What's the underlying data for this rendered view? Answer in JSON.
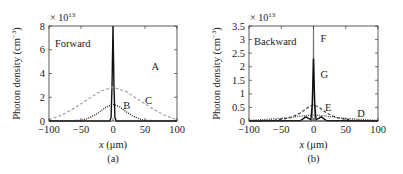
{
  "chart_data": [
    {
      "panel": "(a)",
      "type": "line",
      "title": "Forward",
      "xlabel": "x (μm)",
      "ylabel": "Photon density (cm⁻³)",
      "y_multiplier": "× 10¹³",
      "xlim": [
        -100,
        100
      ],
      "ylim": [
        0,
        8
      ],
      "xticks": [
        -100,
        -50,
        0,
        50,
        100
      ],
      "yticks": [
        0,
        2,
        4,
        6,
        8
      ],
      "grid": false,
      "series": [
        {
          "name": "A",
          "style": "solid",
          "color": "#111111",
          "x": [
            -100,
            -5,
            -3,
            -1.5,
            0,
            1.5,
            3,
            5,
            100
          ],
          "values": [
            0,
            0,
            0.3,
            3.0,
            8.0,
            3.0,
            0.3,
            0,
            0
          ]
        },
        {
          "name": "B",
          "style": "dotted",
          "color": "#222222",
          "x": [
            -100,
            -50,
            -40,
            -30,
            -20,
            -10,
            0,
            10,
            20,
            30,
            40,
            50,
            100
          ],
          "values": [
            0,
            0.05,
            0.2,
            0.45,
            0.8,
            1.2,
            1.4,
            1.2,
            0.8,
            0.45,
            0.2,
            0.05,
            0
          ]
        },
        {
          "name": "C",
          "style": "dashed",
          "color": "#999999",
          "x": [
            -100,
            -80,
            -60,
            -40,
            -20,
            0,
            20,
            40,
            60,
            80,
            100
          ],
          "values": [
            0.1,
            0.5,
            1.1,
            1.8,
            2.5,
            2.85,
            2.5,
            1.8,
            1.1,
            0.5,
            0.1
          ]
        }
      ],
      "annotations": [
        "A",
        "B",
        "C"
      ]
    },
    {
      "panel": "(b)",
      "type": "line",
      "title": "Backward",
      "xlabel": "x (μm)",
      "ylabel": "Photon density (cm⁻³)",
      "y_multiplier": "× 10¹³",
      "xlim": [
        -100,
        100
      ],
      "ylim": [
        0,
        3.5
      ],
      "xticks": [
        -100,
        -50,
        0,
        50,
        100
      ],
      "yticks": [
        0,
        0.5,
        1,
        1.5,
        2,
        2.5,
        3,
        3.5
      ],
      "grid": false,
      "series": [
        {
          "name": "D",
          "style": "dotted",
          "color": "#444444",
          "x": [
            -100,
            -80,
            -60,
            -40,
            -20,
            0,
            20,
            40,
            60,
            80,
            100
          ],
          "values": [
            0.02,
            0.05,
            0.08,
            0.12,
            0.18,
            0.22,
            0.18,
            0.12,
            0.08,
            0.05,
            0.02
          ]
        },
        {
          "name": "E",
          "style": "dashed",
          "color": "#333333",
          "x": [
            -100,
            -60,
            -40,
            -30,
            -20,
            -10,
            0,
            10,
            20,
            30,
            40,
            60,
            100
          ],
          "values": [
            0,
            0.03,
            0.1,
            0.18,
            0.3,
            0.48,
            0.6,
            0.48,
            0.3,
            0.18,
            0.1,
            0.03,
            0
          ]
        },
        {
          "name": "F",
          "style": "solid",
          "color": "#777777",
          "x": [
            -100,
            -2,
            -0.5,
            0,
            0.5,
            2,
            100
          ],
          "values": [
            0,
            0,
            1.5,
            3.5,
            1.5,
            0,
            0
          ]
        },
        {
          "name": "G",
          "style": "solid",
          "color": "#111111",
          "x": [
            -100,
            -20,
            -12,
            -8,
            -4,
            -2,
            0,
            2,
            4,
            8,
            12,
            20,
            100
          ],
          "values": [
            0,
            0.02,
            0.15,
            0.1,
            0.05,
            0.6,
            2.3,
            0.6,
            0.05,
            0.1,
            0.15,
            0.02,
            0
          ]
        }
      ],
      "annotations": [
        "D",
        "E",
        "F",
        "G"
      ]
    }
  ]
}
